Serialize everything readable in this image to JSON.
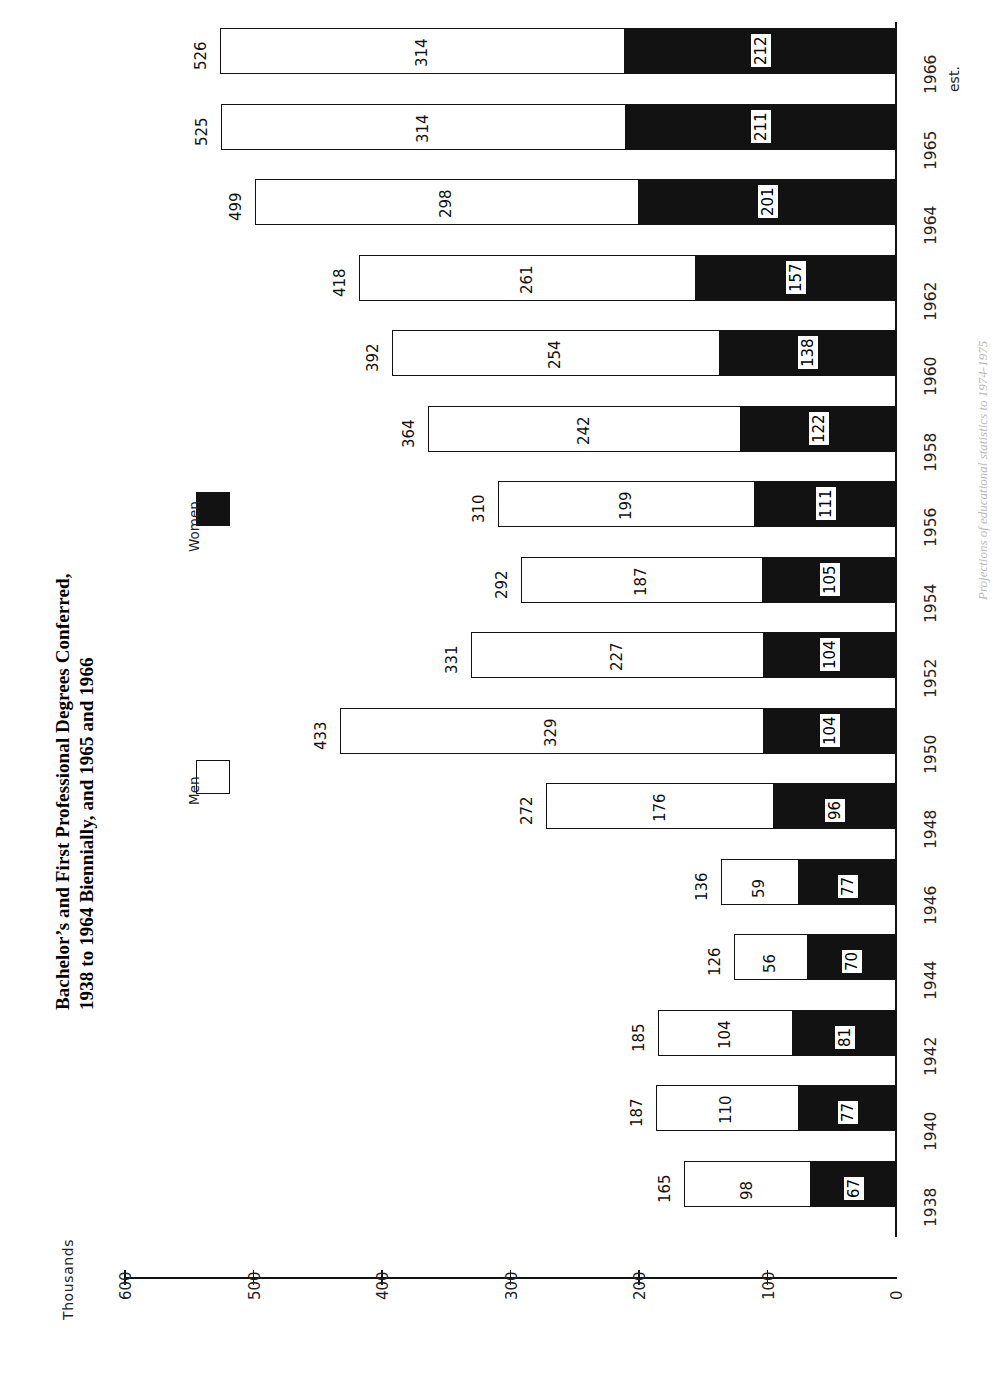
{
  "title": {
    "line1": "Bachelor’s and First Professional Degrees Conferred,",
    "line2": "1938 to 1964 Biennially, and 1965 and 1966"
  },
  "legend": {
    "position": "upper-left",
    "entries": [
      {
        "label": "Men",
        "swatch": "open-square",
        "color": "#ffffff"
      },
      {
        "label": "Women",
        "swatch": "filled-square",
        "color": "#121212"
      }
    ]
  },
  "axis": {
    "title": "Thousands",
    "ticks": [
      "600",
      "500",
      "400",
      "300",
      "200",
      "100",
      "0"
    ],
    "min": 0,
    "max": 600
  },
  "notes": {
    "estimate_marker": "est.",
    "source": "Projections of educational statistics to 1974-1975"
  },
  "chart_data": {
    "type": "bar",
    "orientation": "horizontal-stacked",
    "xlabel": "Thousands",
    "ylabel": "",
    "xlim": [
      0,
      600
    ],
    "grid": false,
    "legend_position": "upper-left",
    "categories": [
      "1938",
      "1940",
      "1942",
      "1944",
      "1946",
      "1948",
      "1950",
      "1952",
      "1954",
      "1956",
      "1958",
      "1960",
      "1962",
      "1964",
      "1965",
      "1966"
    ],
    "series": [
      {
        "name": "Women",
        "color": "#121212",
        "values": [
          67,
          77,
          81,
          70,
          77,
          96,
          104,
          104,
          105,
          111,
          122,
          138,
          157,
          201,
          211,
          212
        ]
      },
      {
        "name": "Men",
        "color": "#ffffff",
        "values": [
          98,
          110,
          104,
          56,
          59,
          176,
          329,
          227,
          187,
          199,
          242,
          254,
          261,
          298,
          314,
          314
        ]
      }
    ],
    "totals": [
      165,
      187,
      185,
      126,
      136,
      272,
      433,
      331,
      292,
      310,
      364,
      392,
      418,
      499,
      525,
      526
    ],
    "estimated_categories": [
      "1966"
    ]
  }
}
